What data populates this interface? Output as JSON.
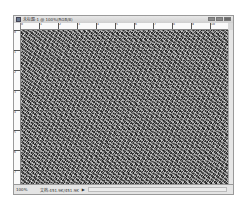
{
  "window": {
    "title": "未标题-1 @ 100%(RGB/8)",
    "controls": [
      "minimize",
      "maximize",
      "close"
    ]
  },
  "rulers": {
    "horizontal_labels": [
      "0",
      "1",
      "2",
      "3",
      "4",
      "5",
      "6",
      "7",
      "8",
      "9",
      "10"
    ],
    "vertical_labels": [
      "0",
      "1",
      "2",
      "3",
      "4",
      "5",
      "6",
      "7"
    ]
  },
  "canvas": {
    "content": "random noise texture (grayscale)"
  },
  "status_bar": {
    "zoom": "100%",
    "doc_info": "文档:451.9K/451.9K",
    "arrow": "▶"
  }
}
